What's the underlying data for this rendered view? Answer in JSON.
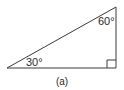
{
  "figure": {
    "caption": "(a)",
    "shape": "right-triangle",
    "angles": {
      "top": "60°",
      "left": "30°",
      "right_angle_marker": "90°"
    },
    "colors": {
      "stroke": "#3a3a3a",
      "text": "#2a2a2a",
      "background": "#ffffff"
    }
  }
}
